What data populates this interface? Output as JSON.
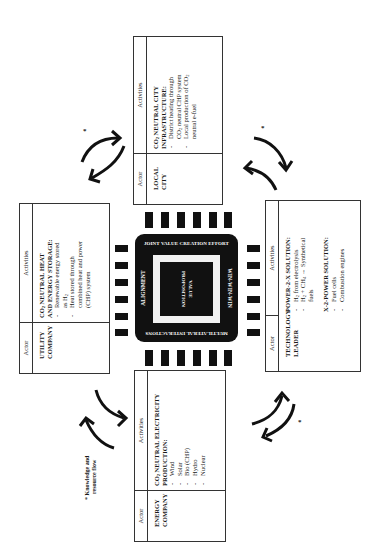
{
  "figure": {
    "type": "business ecosystem diagram (rotated 90° counter-clockwise)",
    "column_headers": {
      "actor": "Actor",
      "activities": "Activities"
    }
  },
  "center_chip": {
    "top": "JOINT VALUE CREATION EFFORT",
    "left": "ALIGNMENT",
    "right": "WIN-WIN-WIN",
    "bottom": "MULTILATERAL INTERACTIONS",
    "core_line1": "VALUE",
    "core_line2": "PROPOSITION"
  },
  "boxes": {
    "local_city": {
      "actor_line1": "LOCAL",
      "actor_line2": "CITY",
      "title_line1_pre": "CO",
      "title_line1_sub": "2",
      "title_line1_post": " NEUTRAL CITY",
      "title_line2": "INFRASTRUCTURE:",
      "items": [
        {
          "pre": "District heating through",
          "line2_pre": "CO",
          "line2_sub": "2",
          "line2_post": " neutral CHP system"
        },
        {
          "pre": "Local production of CO",
          "sub": "2",
          "line2_pre": "neutral e-fuel"
        }
      ]
    },
    "utility": {
      "actor_line1": "UTILITY",
      "actor_line2": "COMPANY",
      "title_line1_pre": "CO",
      "title_line1_sub": "2",
      "title_line1_post": " NEUTRAL HEAT",
      "title_line2": "AND ENERGY STORAGE:",
      "items": [
        {
          "pre": "Renewable energy stored",
          "line2_pre": "as H",
          "line2_sub": "2"
        },
        {
          "pre": "Heat stored through",
          "line2_pre": "combined heat and power",
          "line3": "(CHP) system"
        }
      ]
    },
    "technology": {
      "actor_line1": "TECHNOLOGY",
      "actor_line2": "LEADER",
      "section1_title": "POWER-2-X SOLUTION:",
      "section1_items": [
        {
          "pre": "H",
          "sub": "2",
          "post": " from electrolysis"
        },
        {
          "pre": "H",
          "sub": "2",
          "post": " + CH",
          "sub2": "4",
          "post2": " → Synthetical",
          "line2": "fuels"
        }
      ],
      "section2_title": "X-2-POWER SOLUTION:",
      "section2_items": [
        "Fuel cells",
        "Combustion engines"
      ]
    },
    "energy": {
      "actor_line1": "ENERGY",
      "actor_line2": "COMPANY",
      "title_line1_pre": "CO",
      "title_line1_sub": "2",
      "title_line1_post": " NEUTRAL ELECTRICITY",
      "title_line2": "PRODUCTION:",
      "items": [
        "Wind",
        "Solar",
        "Bio (CHP)",
        "Hydro",
        "Nuclear"
      ]
    }
  },
  "legend": {
    "star": "*",
    "footnote_line1": "* Knowledge and",
    "footnote_line2": "resource flow"
  },
  "colors": {
    "ink": "#111111",
    "frame": "#f2f2f2",
    "border": "#333333"
  }
}
